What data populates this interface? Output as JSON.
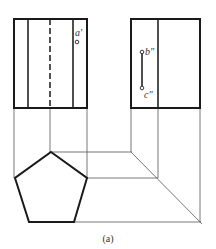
{
  "diagram": {
    "type": "orthographic-projection",
    "views": {
      "front": {
        "name": "front-view",
        "point_labels": [
          "a'"
        ]
      },
      "side": {
        "name": "side-view",
        "point_labels": [
          "b\"",
          "c\""
        ]
      },
      "top": {
        "name": "top-view",
        "shape": "pentagon"
      }
    },
    "labels": {
      "a_prime": "a'",
      "b_double_prime": "b\"",
      "c_double_prime": "c\""
    },
    "caption": "(a)",
    "colors": {
      "line": "#1a1a1a",
      "projection_line": "#555555",
      "background": "#ffffff"
    }
  }
}
